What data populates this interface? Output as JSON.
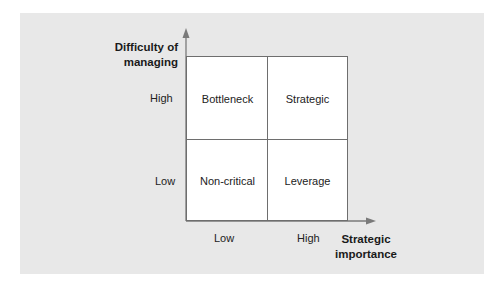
{
  "diagram": {
    "type": "2x2 matrix",
    "y_axis": {
      "title_line1": "Difficulty of",
      "title_line2": "managing",
      "ticks": {
        "high": "High",
        "low": "Low"
      }
    },
    "x_axis": {
      "title_line1": "Strategic",
      "title_line2": "importance",
      "ticks": {
        "low": "Low",
        "high": "High"
      }
    },
    "quadrants": {
      "top_left": "Bottleneck",
      "top_right": "Strategic",
      "bottom_left": "Non-critical",
      "bottom_right": "Leverage"
    },
    "colors": {
      "panel_bg": "#e8e8e8",
      "grid_bg": "#ffffff",
      "lines": "#6e6e6e"
    }
  }
}
